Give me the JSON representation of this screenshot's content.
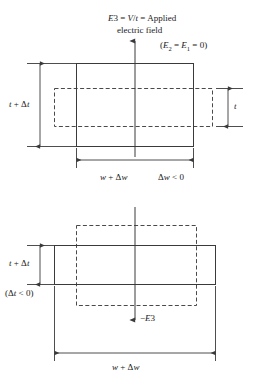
{
  "figure": {
    "title_line1": "E3 = V/t = Applied",
    "title_line2": "electric field",
    "field_note": "(E2 = E1 = 0)",
    "top_panel": {
      "height_label": "t + Δt",
      "inner_height_label": "t",
      "width_label": "w + Δw",
      "width_note": "Δw < 0",
      "field_arrow_label": "E3",
      "arrow_direction": "up"
    },
    "bottom_panel": {
      "height_label": "t + Δt",
      "height_note": "(Δt < 0)",
      "width_label": "w + Δw",
      "field_arrow_label": "−E3",
      "arrow_direction": "down"
    },
    "colors": {
      "line": "#3a3a3a",
      "dashed": "#4a4a4a",
      "text": "#1a1a1a",
      "background": "#ffffff"
    }
  }
}
